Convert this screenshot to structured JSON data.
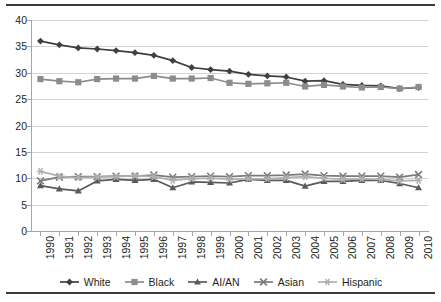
{
  "chart_data": {
    "type": "line",
    "title": "",
    "xlabel": "",
    "ylabel": "",
    "ylim": [
      0,
      40
    ],
    "ytick_step": 5,
    "yticks": [
      "0",
      "5",
      "10",
      "15",
      "20",
      "25",
      "30",
      "35",
      "40"
    ],
    "grid": true,
    "legend_position": "bottom",
    "categories": [
      "1990",
      "1991",
      "1992",
      "1993",
      "1994",
      "1995",
      "1996",
      "1997",
      "1998",
      "1999",
      "2000",
      "2001",
      "2002",
      "2003",
      "2004",
      "2005",
      "2006",
      "2007",
      "2008",
      "2009",
      "2010"
    ],
    "series": [
      {
        "name": "White",
        "marker": "diamond",
        "color": "#3f3f3f",
        "values": [
          36.0,
          35.3,
          34.7,
          34.5,
          34.2,
          33.8,
          33.3,
          32.3,
          31.0,
          30.6,
          30.3,
          29.7,
          29.4,
          29.2,
          28.4,
          28.5,
          27.8,
          27.6,
          27.5,
          27.0,
          27.2
        ]
      },
      {
        "name": "Black",
        "marker": "square",
        "color": "#8c8c8c",
        "values": [
          28.8,
          28.4,
          28.2,
          28.8,
          28.9,
          28.9,
          29.4,
          28.9,
          28.9,
          29.0,
          28.1,
          27.9,
          28.0,
          28.1,
          27.4,
          27.7,
          27.4,
          27.2,
          27.3,
          27.0,
          27.3
        ]
      },
      {
        "name": "AI/AN",
        "marker": "triangle",
        "color": "#5a5a5a",
        "values": [
          8.6,
          8.0,
          7.6,
          9.5,
          9.8,
          9.6,
          9.8,
          8.2,
          9.3,
          9.2,
          9.1,
          9.8,
          9.6,
          9.6,
          8.5,
          9.4,
          9.4,
          9.6,
          9.6,
          9.0,
          8.2
        ]
      },
      {
        "name": "Asian",
        "marker": "x",
        "color": "#7a7a7a",
        "values": [
          9.5,
          10.2,
          10.3,
          10.3,
          10.4,
          10.4,
          10.6,
          10.2,
          10.3,
          10.4,
          10.3,
          10.5,
          10.5,
          10.6,
          10.8,
          10.5,
          10.4,
          10.4,
          10.4,
          10.2,
          10.7
        ]
      },
      {
        "name": "Hispanic",
        "marker": "asterisk",
        "color": "#b0b0b0",
        "values": [
          11.3,
          10.4,
          10.1,
          10.2,
          10.3,
          10.5,
          10.3,
          9.6,
          9.9,
          10.0,
          9.8,
          9.9,
          9.9,
          10.1,
          10.3,
          10.0,
          9.8,
          9.9,
          9.8,
          9.5,
          9.6
        ]
      }
    ]
  },
  "legend": {
    "items": [
      {
        "label": "White"
      },
      {
        "label": "Black"
      },
      {
        "label": "AI/AN"
      },
      {
        "label": "Asian"
      },
      {
        "label": "Hispanic"
      }
    ]
  }
}
